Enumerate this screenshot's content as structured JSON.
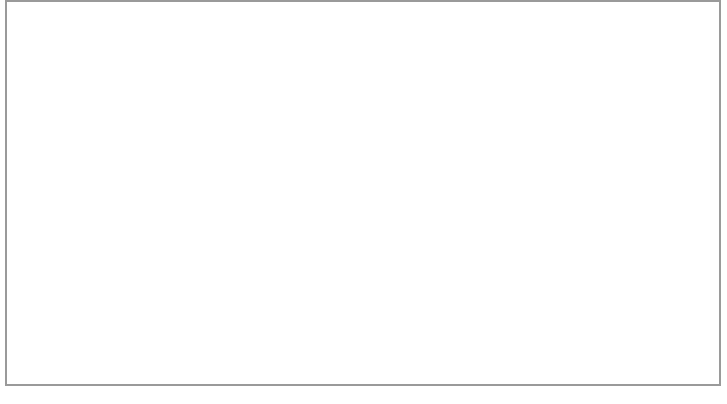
{
  "page": {
    "border_color": "#9a9a9a",
    "background_color": "#ffffff"
  },
  "caption": {
    "lines": [
      "A standard spinner can almost be jig-fished. If the bottom is rolling, you can make the spin-",
      "ner sink with a series of spin-stops, then jerk the rod tip to make the spinner spoon begin",
      "rotating again. In flowing water, the spinner is often cast somewhat upstream."
    ],
    "full_text": "A standard spinner can almost be jig-fished. If the bottom is rolling, you can make the spinner sink with a series of spin-stops, then jerk the rod tip to make the spinner spoon begin rotating again. In flowing water, the spinner is often cast somewhat upstream.",
    "style": "italic",
    "align": "center",
    "color": "#1a1a1a"
  },
  "scene": {
    "angler": {
      "label": "angler-silhouette",
      "color": "#000000",
      "facing": "right",
      "wears_cap": true
    },
    "rod": {
      "label": "fishing-rod",
      "color": "#1c1c1c",
      "tip_x": 156,
      "tip_y": 94
    },
    "cast_arc": {
      "label": "cast-trajectory-arc",
      "color": "#4a4a4a",
      "direction_arrow": "right",
      "arrow_x": 390,
      "arrow_y": 23,
      "entry_x": 651,
      "entry_y": 196
    },
    "taut_line": {
      "label": "line-to-lure",
      "color": "#3a3a3a",
      "arrow_direction": "up-left",
      "arrow_x": 266,
      "arrow_y": 230
    },
    "water_surface": {
      "label": "water-surface-line",
      "color": "#cfcfcf",
      "y_left": 190,
      "y_right": 182
    },
    "river_bottom": {
      "label": "river-bottom-contour",
      "fill_color": "#e9e9e9",
      "shade_color": "#c9c9c9"
    },
    "retrieve_path": {
      "label": "sink-and-lift-retrieve-path",
      "color": "#111111",
      "stroke_width": 2.0,
      "arrow_direction": "leftward-toward-angler",
      "arrow_positions": [
        {
          "x": 597,
          "y": 199
        },
        {
          "x": 487,
          "y": 230
        },
        {
          "x": 416,
          "y": 279
        },
        {
          "x": 353,
          "y": 270
        },
        {
          "x": 266,
          "y": 230
        }
      ],
      "description": "Zigzag: spinner sinks to bottom then is lifted in a series of spin-stops"
    }
  },
  "inset": {
    "label": "underwater-inset-photo",
    "border_color": "#8d8d8d",
    "subjects": {
      "fish": "trout",
      "lure": "spinner",
      "line": "fishing-line"
    },
    "water_tint": "#ededed"
  }
}
